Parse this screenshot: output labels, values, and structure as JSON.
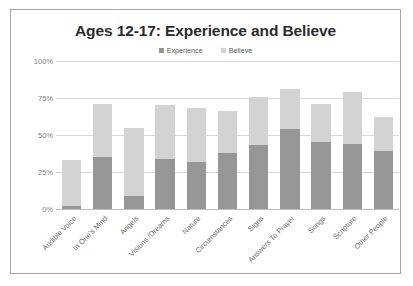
{
  "chart_data": {
    "type": "bar",
    "subtype": "stacked-bar",
    "title": "Ages 12-17: Experience and Believe",
    "xlabel": "",
    "ylabel": "",
    "ylim": [
      0,
      100
    ],
    "ytick_labels": [
      "0%",
      "25%",
      "50%",
      "75%",
      "100%"
    ],
    "ytick_values": [
      0,
      25,
      50,
      75,
      100
    ],
    "grid": true,
    "legend_position": "top-center",
    "categories": [
      "Audible Voice",
      "In One's Mind",
      "Angels",
      "Visions /Dreams",
      "Nature",
      "Circumstances",
      "Signs",
      "Answers To Prayer",
      "Songs",
      "Scripture",
      "Other People"
    ],
    "series": [
      {
        "name": "Experience",
        "color": "#969696",
        "values": [
          2,
          35,
          9,
          34,
          32,
          38,
          43,
          54,
          45,
          44,
          39
        ]
      },
      {
        "name": "Believe",
        "color": "#d3d3d3",
        "values": [
          31,
          36,
          46,
          36,
          36,
          28,
          33,
          27,
          26,
          35,
          23
        ]
      }
    ],
    "totals": [
      33,
      71,
      55,
      70,
      68,
      66,
      76,
      81,
      71,
      79,
      62
    ]
  },
  "legend": {
    "marker": "■",
    "entries": [
      {
        "label": "Experience",
        "color": "#969696"
      },
      {
        "label": "Believe",
        "color": "#d3d3d3"
      }
    ]
  },
  "frame": {
    "border_color": "#a6a6a6",
    "background": "#ffffff"
  }
}
